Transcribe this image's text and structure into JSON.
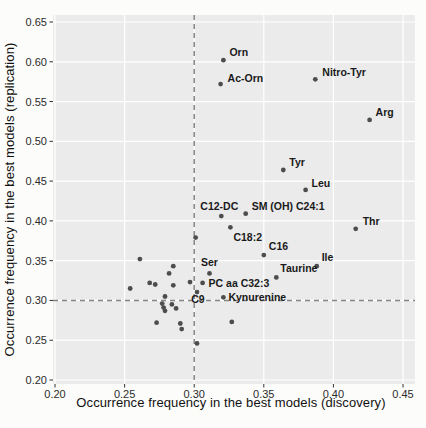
{
  "figure": {
    "page_bg": "#fcfcfa",
    "panel_bg": "#ebebeb",
    "grid_color": "#ffffff",
    "point_color": "#4d4d4d",
    "ref_line_color": "#858585",
    "tick_color": "#333333",
    "label_color": "#1a1a1a"
  },
  "chart_data": {
    "type": "scatter",
    "title": "",
    "xlabel": "Occurrence frequency in the best models (discovery)",
    "ylabel": "Occurrence frequency in the best models (replication)",
    "xlim": [
      0.2,
      0.45
    ],
    "ylim": [
      0.2,
      0.65
    ],
    "xticks": [
      "0.20",
      "0.25",
      "0.30",
      "0.35",
      "0.40",
      "0.45"
    ],
    "yticks": [
      "0.20",
      "0.25",
      "0.30",
      "0.35",
      "0.40",
      "0.45",
      "0.50",
      "0.55",
      "0.60",
      "0.65"
    ],
    "grid": true,
    "legend": "none",
    "reference_lines": {
      "x": 0.3,
      "y": 0.3,
      "style": "dashed"
    },
    "labeled_points": [
      {
        "label": "Orn",
        "x": 0.321,
        "y": 0.602,
        "dx": 6,
        "dy": -4,
        "anchor": "start"
      },
      {
        "label": "Ac-Orn",
        "x": 0.319,
        "y": 0.572,
        "dx": 7,
        "dy": -2,
        "anchor": "start"
      },
      {
        "label": "Nitro-Tyr",
        "x": 0.387,
        "y": 0.578,
        "dx": 7,
        "dy": -3,
        "anchor": "start"
      },
      {
        "label": "Arg",
        "x": 0.426,
        "y": 0.527,
        "dx": 6,
        "dy": -4,
        "anchor": "start"
      },
      {
        "label": "Tyr",
        "x": 0.364,
        "y": 0.464,
        "dx": 6,
        "dy": -4,
        "anchor": "start"
      },
      {
        "label": "Leu",
        "x": 0.38,
        "y": 0.439,
        "dx": 6,
        "dy": -3,
        "anchor": "start"
      },
      {
        "label": "C12-DC",
        "x": 0.3195,
        "y": 0.406,
        "dx": -2,
        "dy": -6,
        "anchor": "middle"
      },
      {
        "label": "SM (OH) C24:1",
        "x": 0.337,
        "y": 0.409,
        "dx": 6,
        "dy": -4,
        "anchor": "start"
      },
      {
        "label": "Thr",
        "x": 0.416,
        "y": 0.39,
        "dx": 7,
        "dy": -4,
        "anchor": "start"
      },
      {
        "label": "C18:2",
        "x": 0.326,
        "y": 0.392,
        "dx": 3,
        "dy": 14,
        "anchor": "start"
      },
      {
        "label": "C16",
        "x": 0.35,
        "y": 0.357,
        "dx": 5,
        "dy": -5,
        "anchor": "start"
      },
      {
        "label": "Ile",
        "x": 0.388,
        "y": 0.343,
        "dx": 5,
        "dy": -5,
        "anchor": "start"
      },
      {
        "label": "Ser",
        "x": 0.311,
        "y": 0.334,
        "dx": 0,
        "dy": -7,
        "anchor": "middle"
      },
      {
        "label": "Taurine",
        "x": 0.359,
        "y": 0.329,
        "dx": 4,
        "dy": -5,
        "anchor": "start"
      },
      {
        "label": "PC aa C32:3",
        "x": 0.306,
        "y": 0.322,
        "dx": 6,
        "dy": 4,
        "anchor": "start"
      },
      {
        "label": "C9",
        "x": 0.302,
        "y": 0.3105,
        "dx": 1,
        "dy": 11,
        "anchor": "middle"
      },
      {
        "label": "Kynurenine",
        "x": 0.321,
        "y": 0.304,
        "dx": 5,
        "dy": 4,
        "anchor": "start"
      }
    ],
    "unlabeled_points": [
      [
        0.301,
        0.379
      ],
      [
        0.261,
        0.352
      ],
      [
        0.285,
        0.343
      ],
      [
        0.282,
        0.334
      ],
      [
        0.268,
        0.322
      ],
      [
        0.272,
        0.32
      ],
      [
        0.254,
        0.315
      ],
      [
        0.285,
        0.319
      ],
      [
        0.297,
        0.323
      ],
      [
        0.279,
        0.305
      ],
      [
        0.277,
        0.296
      ],
      [
        0.284,
        0.295
      ],
      [
        0.278,
        0.291
      ],
      [
        0.279,
        0.287
      ],
      [
        0.287,
        0.29
      ],
      [
        0.273,
        0.272
      ],
      [
        0.29,
        0.271
      ],
      [
        0.291,
        0.264
      ],
      [
        0.302,
        0.246
      ],
      [
        0.327,
        0.273
      ]
    ]
  }
}
